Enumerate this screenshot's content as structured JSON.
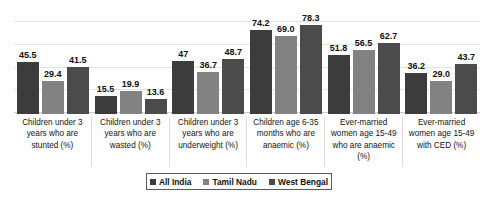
{
  "chart_data": {
    "type": "bar",
    "title": "",
    "subtitle": "",
    "xlabel": "",
    "ylabel": "",
    "ylim": [
      0,
      95
    ],
    "grid": true,
    "gridline_values": [
      20,
      40,
      60,
      80
    ],
    "legend_position": "bottom",
    "categories": [
      "Children under 3 years who are stunted (%)",
      "Children under 3 years who are wasted (%)",
      "Children under 3 years who are underweight (%)",
      "Children age 6-35 months who are anaemic (%)",
      "Ever-married women age 15-49 who are anaemic (%)",
      "Ever-married women age 15-49 with CED (%)"
    ],
    "series": [
      {
        "name": "All India",
        "color": "#3c3c3c",
        "values": [
          45.5,
          15.5,
          47,
          74.2,
          51.8,
          36.2
        ],
        "labels": [
          "45.5",
          "15.5",
          "47",
          "74.2",
          "51.8",
          "36.2"
        ]
      },
      {
        "name": "Tamil Nadu",
        "color": "#828282",
        "values": [
          29.4,
          19.9,
          36.7,
          69.0,
          56.5,
          29.0
        ],
        "labels": [
          "29.4",
          "19.9",
          "36.7",
          "69.0",
          "56.5",
          "29.0"
        ]
      },
      {
        "name": "West Bengal",
        "color": "#4b4b4b",
        "values": [
          41.5,
          13.6,
          48.7,
          78.3,
          62.7,
          43.7
        ],
        "labels": [
          "41.5",
          "13.6",
          "48.7",
          "78.3",
          "62.7",
          "43.7"
        ]
      }
    ]
  },
  "legend": {
    "items": [
      {
        "label": "All India",
        "color": "#3c3c3c"
      },
      {
        "label": "Tamil Nadu",
        "color": "#828282"
      },
      {
        "label": "West Bengal",
        "color": "#4b4b4b"
      }
    ]
  }
}
